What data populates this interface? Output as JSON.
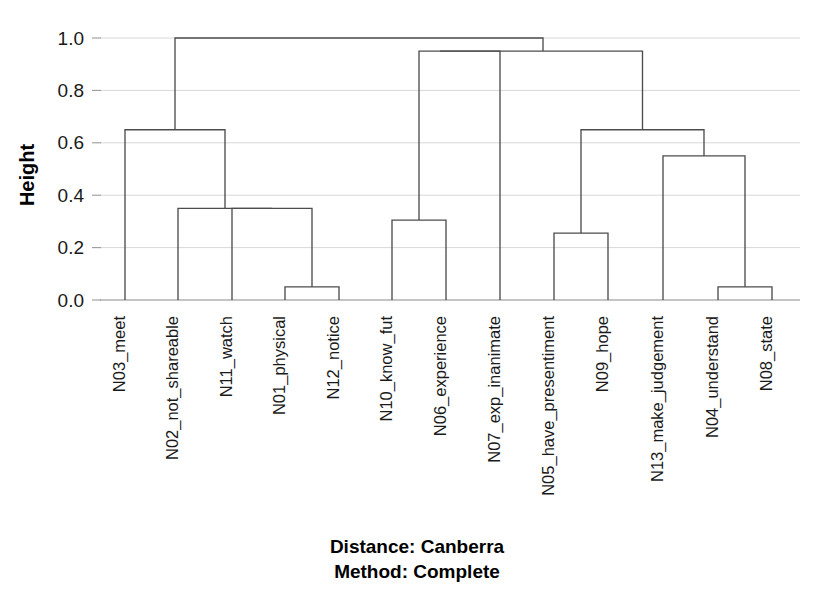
{
  "figure": {
    "type": "dendrogram",
    "background_color": "#ffffff",
    "line_color": "#4d4d4d",
    "grid_color": "#d8d8d8",
    "text_color": "#1a1a1a"
  },
  "axis": {
    "y_title": "Height",
    "y_ticks": [
      "0.0",
      "0.2",
      "0.4",
      "0.6",
      "0.8",
      "1.0"
    ],
    "y_tick_values": [
      0.0,
      0.2,
      0.4,
      0.6,
      0.8,
      1.0
    ],
    "y_min": 0.0,
    "y_max": 1.0,
    "grid": true
  },
  "caption": {
    "line1": "Distance: Canberra",
    "line2": "Method: Complete"
  },
  "chart_data": {
    "type": "dendrogram",
    "title": "",
    "subtitle": "",
    "xlabel": "",
    "ylabel": "Height",
    "ylim": [
      0.0,
      1.0
    ],
    "grid": true,
    "legend": "none",
    "distance_metric": "Canberra",
    "linkage_method": "Complete",
    "annotations": [
      "Distance: Canberra",
      "Method: Complete"
    ],
    "leaf_order": [
      "N03_meet",
      "N02_not_shareable",
      "N11_watch",
      "N01_physical",
      "N12_notice",
      "N10_know_fut",
      "N06_experience",
      "N07_exp_inanimate",
      "N05_have_presentiment",
      "N09_hope",
      "N13_make_judgement",
      "N04_understand",
      "N08_state"
    ],
    "leaf_count": 13,
    "merges": [
      {
        "id": "m1",
        "label": "N01_physical + N12_notice",
        "height": 0.05,
        "members": [
          "N01_physical",
          "N12_notice"
        ]
      },
      {
        "id": "m2",
        "label": "N11_watch + m1",
        "height": 0.35,
        "members": [
          "N11_watch",
          "N01_physical",
          "N12_notice"
        ]
      },
      {
        "id": "m3",
        "label": "N02_not_shareable + m2",
        "height": 0.35,
        "members": [
          "N02_not_shareable",
          "N11_watch",
          "N01_physical",
          "N12_notice"
        ]
      },
      {
        "id": "m4",
        "label": "N03_meet + m3",
        "height": 0.65,
        "members": [
          "N03_meet",
          "N02_not_shareable",
          "N11_watch",
          "N01_physical",
          "N12_notice"
        ]
      },
      {
        "id": "m5",
        "label": "N10_know_fut + N06_experience",
        "height": 0.305,
        "members": [
          "N10_know_fut",
          "N06_experience"
        ]
      },
      {
        "id": "m6",
        "label": "m5 + N07_exp_inanimate",
        "height": 0.95,
        "members": [
          "N10_know_fut",
          "N06_experience",
          "N07_exp_inanimate"
        ]
      },
      {
        "id": "m7",
        "label": "N05_have_presentiment + N09_hope",
        "height": 0.255,
        "members": [
          "N05_have_presentiment",
          "N09_hope"
        ]
      },
      {
        "id": "m8",
        "label": "N04_understand + N08_state",
        "height": 0.05,
        "members": [
          "N04_understand",
          "N08_state"
        ]
      },
      {
        "id": "m9",
        "label": "N13_make_judgement + m8",
        "height": 0.55,
        "members": [
          "N13_make_judgement",
          "N04_understand",
          "N08_state"
        ]
      },
      {
        "id": "m10",
        "label": "m7 + m9",
        "height": 0.65,
        "members": [
          "N05_have_presentiment",
          "N09_hope",
          "N13_make_judgement",
          "N04_understand",
          "N08_state"
        ]
      },
      {
        "id": "m11",
        "label": "m6 right branch",
        "height": 0.95,
        "members": [
          "N10_know_fut",
          "N06_experience",
          "N07_exp_inanimate",
          "N05_have_presentiment",
          "N09_hope",
          "N13_make_judgement",
          "N04_understand",
          "N08_state"
        ]
      },
      {
        "id": "m12",
        "label": "root",
        "height": 1.0,
        "members": [
          "all"
        ]
      }
    ],
    "leaves": [
      {
        "name": "N03_meet",
        "x": 125,
        "merge_height": 0.65
      },
      {
        "name": "N02_not_shareable",
        "x": 178,
        "merge_height": 0.35
      },
      {
        "name": "N11_watch",
        "x": 232,
        "merge_height": 0.35
      },
      {
        "name": "N01_physical",
        "x": 285,
        "merge_height": 0.05
      },
      {
        "name": "N12_notice",
        "x": 339,
        "merge_height": 0.05
      },
      {
        "name": "N10_know_fut",
        "x": 392,
        "merge_height": 0.305
      },
      {
        "name": "N06_experience",
        "x": 446,
        "merge_height": 0.305
      },
      {
        "name": "N07_exp_inanimate",
        "x": 500,
        "merge_height": 0.95
      },
      {
        "name": "N05_have_presentiment",
        "x": 554,
        "merge_height": 0.255
      },
      {
        "name": "N09_hope",
        "x": 608,
        "merge_height": 0.255
      },
      {
        "name": "N13_make_judgement",
        "x": 663,
        "merge_height": 0.55
      },
      {
        "name": "N04_understand",
        "x": 718,
        "merge_height": 0.05
      },
      {
        "name": "N08_state",
        "x": 772,
        "merge_height": 0.05
      }
    ]
  }
}
